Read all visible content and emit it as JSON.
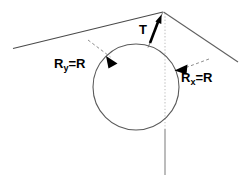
{
  "figure": {
    "type": "geometry-diagram",
    "width": 249,
    "height": 176,
    "background_color": "#ffffff",
    "labels": {
      "tension": {
        "text": "T",
        "symbol": "T",
        "subscript": "",
        "description": "tension label at ridge apex"
      },
      "radius_y": {
        "symbol": "R",
        "subscript": "y",
        "equals": "=",
        "value": "R",
        "full_text": "Ry = R",
        "description": "vertical radius equals R"
      },
      "radius_x": {
        "symbol": "R",
        "subscript": "x",
        "equals": "=",
        "value": "R",
        "full_text": "Rx = R",
        "description": "horizontal radius equals R"
      }
    },
    "colors": {
      "stroke": "#4a4a4a",
      "circle_stroke": "#555555",
      "axis_stroke": "#bbbbbb",
      "dashed_leader": "#777777",
      "arrow_fill": "#000000",
      "text": "#000000"
    },
    "geometry": {
      "apex": {
        "x": 163,
        "y": 12
      },
      "left_roof_end": {
        "x": 13,
        "y": 48
      },
      "right_roof_end": {
        "x": 238,
        "y": 62
      },
      "circle": {
        "cx": 136,
        "cy": 87,
        "r": 43
      },
      "vertical_axis": {
        "x": 165,
        "y_top": 12,
        "y_bottom": 174
      },
      "tension_arrow": {
        "from_x": 149,
        "from_y": 46,
        "to_x": 162,
        "to_y": 16
      },
      "ry_arrow": {
        "from_x": 90,
        "from_y": 42,
        "to_x": 114,
        "to_y": 60
      },
      "rx_arrow": {
        "from_x": 204,
        "from_y": 62,
        "to_x": 177,
        "to_y": 72
      }
    }
  }
}
